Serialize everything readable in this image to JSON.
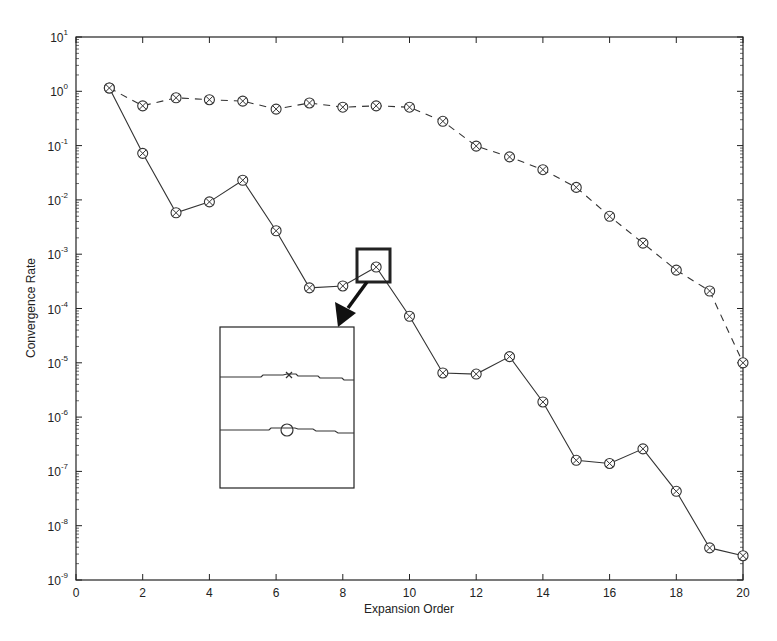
{
  "chart_data": {
    "type": "line",
    "title": "",
    "xlabel": "Expansion Order",
    "ylabel": "Convergence Rate",
    "xscale": "linear",
    "yscale": "log",
    "xlim": [
      0,
      20
    ],
    "ylim": [
      1e-09,
      10
    ],
    "grid": false,
    "legend": null,
    "x_ticks": [
      0,
      2,
      4,
      6,
      8,
      10,
      12,
      14,
      16,
      18,
      20
    ],
    "x_tick_labels": [
      "0",
      "2",
      "4",
      "6",
      "8",
      "10",
      "12",
      "14",
      "16",
      "18",
      "20"
    ],
    "y_ticks_exponents": [
      1,
      0,
      -1,
      -2,
      -3,
      -4,
      -5,
      -6,
      -7,
      -8,
      -9
    ],
    "y_tick_labels": [
      "10^1",
      "10^0",
      "10^-1",
      "10^-2",
      "10^-3",
      "10^-4",
      "10^-5",
      "10^-6",
      "10^-7",
      "10^-8",
      "10^-9"
    ],
    "x": [
      1,
      2,
      3,
      4,
      5,
      6,
      7,
      8,
      9,
      10,
      11,
      12,
      13,
      14,
      15,
      16,
      17,
      18,
      19,
      20
    ],
    "series": [
      {
        "name": "solid",
        "line_style": "solid",
        "marker": "circle-x",
        "color": "#333333",
        "values": [
          1.15,
          0.072,
          0.0058,
          0.0092,
          0.023,
          0.0027,
          0.00024,
          0.00026,
          0.00058,
          7.2e-05,
          6.5e-06,
          6.2e-06,
          1.3e-05,
          1.9e-06,
          1.6e-07,
          1.4e-07,
          2.6e-07,
          4.3e-08,
          3.9e-09,
          2.8e-09
        ]
      },
      {
        "name": "dashed",
        "line_style": "dashed",
        "marker": "circle-x",
        "color": "#333333",
        "values": [
          1.15,
          0.54,
          0.76,
          0.7,
          0.66,
          0.47,
          0.61,
          0.51,
          0.54,
          0.51,
          0.28,
          0.098,
          0.062,
          0.036,
          0.017,
          0.005,
          0.0016,
          0.00051,
          0.00021,
          1e-05
        ]
      }
    ],
    "annotations": [
      {
        "type": "highlight-box",
        "target_x": 9,
        "target_series": "solid",
        "description": "Square around solid-series point at x=9"
      },
      {
        "type": "arrow",
        "from": "highlight-box",
        "to": "inset",
        "description": "Thick black arrow pointing from highlight box to zoomed inset"
      },
      {
        "type": "inset",
        "description": "Magnified view showing two horizontal line traces: upper with x marker, lower with circle marker"
      }
    ]
  },
  "layout": {
    "plot_left": 76,
    "plot_right": 743,
    "plot_top": 37,
    "plot_bottom": 580,
    "line_color": "#333333",
    "frame_color": "#222222"
  }
}
